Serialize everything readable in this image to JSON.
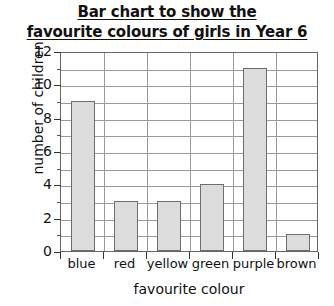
{
  "chart_data": {
    "type": "bar",
    "title": "Bar chart to show the favourite colours of girls in Year 6",
    "title_lines": [
      "Bar chart to show the",
      "favourite colours of girls in Year 6"
    ],
    "xlabel": "favourite colour",
    "ylabel": "number of children",
    "categories": [
      "blue",
      "red",
      "yellow",
      "green",
      "purple",
      "brown"
    ],
    "values": [
      9,
      3,
      3,
      4,
      11,
      1
    ],
    "ylim": [
      0,
      12
    ],
    "ytick_labels": [
      "0",
      "2",
      "4",
      "6",
      "8",
      "10",
      "12"
    ],
    "ytick_values": [
      0,
      2,
      4,
      6,
      8,
      10,
      12
    ],
    "yminor_values": [
      1,
      3,
      5,
      7,
      9,
      11
    ],
    "grid": true,
    "legend": "none",
    "bar_fill_color": "#dcdcdc",
    "bar_border_color": "#6e6e6e",
    "grid_color": "#9a9a9a",
    "axis_color": "#666666",
    "background_color": "#ffffff"
  }
}
